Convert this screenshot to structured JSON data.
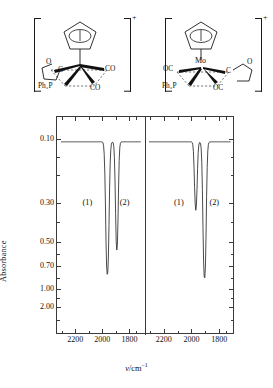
{
  "figure": {
    "structures": [
      {
        "id": "structure-1",
        "charge": "+",
        "metal_label": "",
        "ligands": [
          {
            "name": "cyclopentadienyl",
            "label": ""
          },
          {
            "name": "thf-oxygen",
            "label": "O"
          },
          {
            "name": "thf-carbon",
            "label": "C"
          },
          {
            "name": "phosphine",
            "label": "Ph₃P"
          },
          {
            "name": "carbonyl-right",
            "label": "CO"
          },
          {
            "name": "carbonyl-bottom",
            "label": "CO"
          }
        ]
      },
      {
        "id": "structure-2",
        "charge": "+",
        "metal_label": "Mo",
        "ligands": [
          {
            "name": "cyclopentadienyl",
            "label": ""
          },
          {
            "name": "carbonyl-left",
            "label": "OC"
          },
          {
            "name": "phosphine",
            "label": "Ph₃P"
          },
          {
            "name": "carbonyl-bottom",
            "label": "OC"
          },
          {
            "name": "thf-carbon",
            "label": "C"
          },
          {
            "name": "thf-oxygen",
            "label": "O"
          }
        ]
      }
    ]
  },
  "chart_data": {
    "type": "line",
    "title": "",
    "xlabel": "ν/cm⁻¹",
    "ylabel": "Absorbance",
    "xlabel_parts": {
      "symbol": "ν",
      "unit": "/cm",
      "sup": "−1"
    },
    "xlim": [
      2320,
      1700
    ],
    "xticks": [
      2200,
      2000,
      1800
    ],
    "xtick_labels": [
      "2200",
      "2000",
      "1800"
    ],
    "yticks": [
      0.1,
      0.3,
      0.5,
      0.7,
      1.0,
      2.0
    ],
    "ytick_labels": [
      "0.10",
      "0.30",
      "0.50",
      "0.70",
      "1.00",
      "2.00"
    ],
    "ylim": [
      0.08,
      3.0
    ],
    "y_scale": "log-absorbance (inverted, transmittance-style dips)",
    "grid": false,
    "legend": null,
    "panels": [
      {
        "name": "panel-left",
        "peak_labels": [
          {
            "text": "(1)",
            "x": 2110,
            "y_display": 0.3
          },
          {
            "text": "(2)",
            "x": 1835,
            "y_display": 0.3
          }
        ],
        "baseline": 0.105,
        "series": [
          {
            "name": "ir-trace-left",
            "peaks": [
              {
                "center": 1963,
                "depth": 0.8,
                "width": 16,
                "label": "(1)"
              },
              {
                "center": 1893,
                "depth": 0.56,
                "width": 14,
                "label": "(2)"
              }
            ]
          }
        ]
      },
      {
        "name": "panel-right",
        "peak_labels": [
          {
            "text": "(1)",
            "x": 2090,
            "y_display": 0.3
          },
          {
            "text": "(2)",
            "x": 1835,
            "y_display": 0.3
          }
        ],
        "baseline": 0.105,
        "series": [
          {
            "name": "ir-trace-right",
            "peaks": [
              {
                "center": 1968,
                "depth": 0.33,
                "width": 14,
                "label": "(1)"
              },
              {
                "center": 1905,
                "depth": 0.85,
                "width": 15,
                "label": "(2)"
              }
            ]
          }
        ]
      }
    ]
  },
  "colors": {
    "ink": "#1a1a1a",
    "axis": "#3a3a3a",
    "trace": "#2b2b2b",
    "background": "#ffffff"
  }
}
